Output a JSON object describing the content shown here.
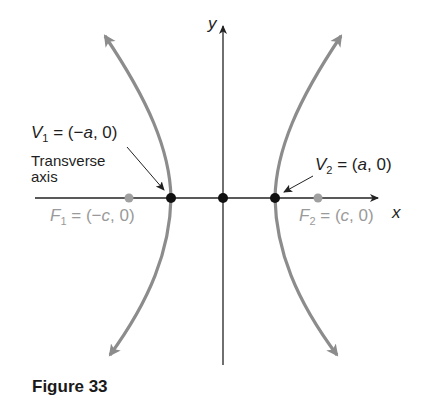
{
  "figure": {
    "caption": "Figure 33",
    "axes": {
      "x_label": "x",
      "y_label": "y"
    },
    "labels": {
      "v1": {
        "name": "V",
        "sub": "1",
        "eq": " = (",
        "neg": "−",
        "var": "a",
        "rest": ", 0)"
      },
      "v2": {
        "name": "V",
        "sub": "2",
        "eq": " = (",
        "var": "a",
        "rest": ", 0)"
      },
      "f1": {
        "name": "F",
        "sub": "1",
        "eq": " = (",
        "neg": "−",
        "var": "c",
        "rest": ", 0)"
      },
      "f2": {
        "name": "F",
        "sub": "2",
        "eq": " = (",
        "var": "c",
        "rest": ", 0)"
      },
      "transverse_line1": "Transverse",
      "transverse_line2": "axis"
    },
    "colors": {
      "curve": "#8c8c8c",
      "axis": "#222222",
      "vertex": "#111111",
      "focus": "#a0a0a0"
    },
    "points": [
      {
        "name": "V1",
        "coord": "(-a, 0)",
        "kind": "vertex"
      },
      {
        "name": "O",
        "coord": "(0, 0)",
        "kind": "center"
      },
      {
        "name": "V2",
        "coord": "(a, 0)",
        "kind": "vertex"
      },
      {
        "name": "F1",
        "coord": "(-c, 0)",
        "kind": "focus"
      },
      {
        "name": "F2",
        "coord": "(c, 0)",
        "kind": "focus"
      }
    ]
  }
}
